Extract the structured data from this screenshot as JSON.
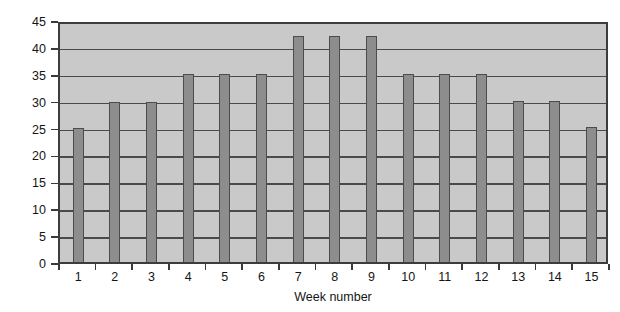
{
  "chart_data": {
    "type": "bar",
    "title": "",
    "xlabel": "Week number",
    "ylabel": "Weekly volume (km)",
    "categories": [
      "1",
      "2",
      "3",
      "4",
      "5",
      "6",
      "7",
      "8",
      "9",
      "10",
      "11",
      "12",
      "13",
      "14",
      "15"
    ],
    "values": [
      25.2,
      30.2,
      30.2,
      35.3,
      35.3,
      35.3,
      42.4,
      42.4,
      42.4,
      35.3,
      35.3,
      35.3,
      30.3,
      30.3,
      25.4
    ],
    "series": [
      {
        "name": "Weekly volume",
        "values": [
          25.2,
          30.2,
          30.2,
          35.3,
          35.3,
          35.3,
          42.4,
          42.4,
          42.4,
          35.3,
          35.3,
          35.3,
          30.3,
          30.3,
          25.4
        ]
      }
    ],
    "ylim": [
      0,
      45
    ],
    "yticks": [
      0,
      5,
      10,
      15,
      20,
      25,
      30,
      35,
      40,
      45
    ],
    "ytick_labels": [
      "0",
      "5",
      "10",
      "15",
      "20",
      "25",
      "30",
      "35",
      "40",
      "45"
    ],
    "grid": "horizontal",
    "legend": "none",
    "colors": {
      "bar_fill": "#8d8d8d",
      "bar_edge": "#4c4c4c",
      "plot_background": "#c9c9c9",
      "gridline": "#4a4a4a",
      "axis": "#3d3d3d",
      "text": "#151515",
      "page_background": "#ffffff"
    }
  }
}
